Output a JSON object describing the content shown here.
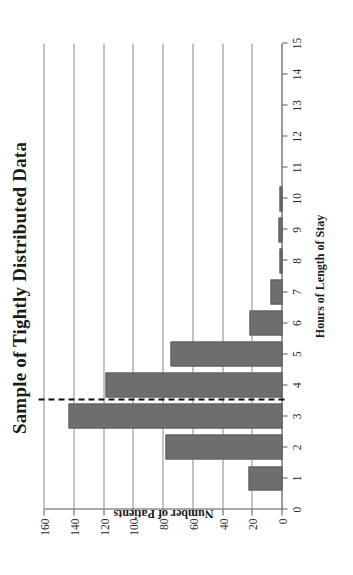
{
  "chart_data": {
    "type": "bar",
    "orientation": "vertical-rendered-rotated",
    "title": "Sample of Tightly Distributed Data",
    "xlabel": "Hours of Length of Stay",
    "ylabel": "Number of Patients",
    "categories": [
      1,
      2,
      3,
      4,
      5,
      6,
      7,
      8,
      9,
      10
    ],
    "values": [
      23,
      79,
      144,
      119,
      75,
      22,
      8,
      2,
      3,
      2
    ],
    "series": [
      {
        "name": "Number of Patients",
        "values": [
          23,
          79,
          144,
          119,
          75,
          22,
          8,
          2,
          3,
          2
        ]
      }
    ],
    "xlim": [
      0,
      15
    ],
    "ylim": [
      0,
      160
    ],
    "x_ticks": [
      0,
      1,
      2,
      3,
      4,
      5,
      6,
      7,
      8,
      9,
      10,
      11,
      12,
      13,
      14,
      15
    ],
    "x_tick_labels": [
      "0",
      "1",
      "2",
      "3",
      "4",
      "5",
      "6",
      "7",
      "8",
      "9",
      "10",
      "11",
      "12",
      "13",
      "14",
      "15"
    ],
    "y_ticks": [
      0,
      20,
      40,
      60,
      80,
      100,
      120,
      140,
      160
    ],
    "y_tick_labels": [
      "0",
      "20",
      "40",
      "60",
      "80",
      "100",
      "120",
      "140",
      "160"
    ],
    "grid": "horizontal",
    "legend": "none",
    "bar_color": "#6e6e6e",
    "annotations": [
      {
        "name": "threshold-line",
        "kind": "dashed-reference-line",
        "axis": "x",
        "value": 3.5,
        "color": "#111111"
      }
    ]
  }
}
